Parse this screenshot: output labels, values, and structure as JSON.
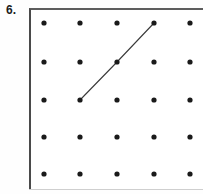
{
  "problem": {
    "number_label": "6.",
    "kind": "dot-grid-geoboard"
  },
  "grid": {
    "rows": 5,
    "columns": 5,
    "dot_color": "#1a1a1a",
    "dot_radius": 2.6,
    "column_x": [
      44,
      80,
      117,
      154,
      190
    ],
    "row_y": [
      23,
      62,
      100,
      137,
      174
    ],
    "panel": {
      "left": 29,
      "top": 8,
      "width": 174,
      "height": 182,
      "border_color": "#4a4a4a",
      "background": "#ffffff"
    }
  },
  "segments": [
    {
      "name": "diagonal-segment",
      "color": "#3a3a3a",
      "width": 1.1,
      "points": [
        {
          "row": 3,
          "col": 2,
          "x": 80,
          "y": 100
        },
        {
          "row": 2,
          "col": 3,
          "x": 117,
          "y": 62
        },
        {
          "row": 1,
          "col": 4,
          "x": 154,
          "y": 23
        }
      ]
    }
  ],
  "colors": {
    "page_background": "#fefefe",
    "ink": "#1c1c1c",
    "rule": "#cfcfcf"
  }
}
